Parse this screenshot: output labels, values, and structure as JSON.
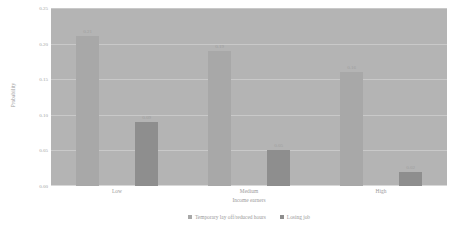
{
  "chart_data": {
    "type": "bar",
    "title": "",
    "subtitle": "",
    "xlabel": "Income earners",
    "ylabel": "Probability",
    "categories": [
      "Low",
      "Medium",
      "High"
    ],
    "series": [
      {
        "name": "Temporary lay off/reduced hours",
        "color": "#a8a8a8",
        "values": [
          0.21,
          0.19,
          0.16
        ],
        "labels": [
          "0.21",
          "0.19",
          "0.16"
        ]
      },
      {
        "name": "Losing job",
        "color": "#8e8e8e",
        "values": [
          0.09,
          0.05,
          0.02
        ],
        "labels": [
          "0.09",
          "0.05",
          "0.02"
        ]
      }
    ],
    "ylim": [
      0.0,
      0.25
    ],
    "yticks": [
      0.0,
      0.05,
      0.1,
      0.15,
      0.2,
      0.25
    ],
    "ytick_labels": [
      "0.00",
      "0.05",
      "0.10",
      "0.15",
      "0.20",
      "0.25"
    ],
    "grid": true,
    "legend_position": "bottom",
    "plot_background": "#b4b4b4",
    "gridline_color": "#c9c9c9"
  },
  "legend": {
    "items": [
      {
        "label": "Temporary lay off/reduced hours"
      },
      {
        "label": "Losing job"
      }
    ]
  }
}
